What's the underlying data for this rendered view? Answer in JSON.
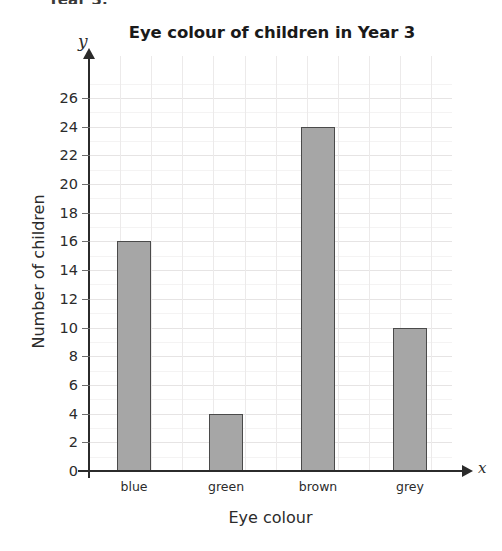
{
  "page": {
    "cropped_header_text": "Year 3."
  },
  "chart_data": {
    "type": "bar",
    "title": "Eye colour of children in Year 3",
    "categories": [
      "blue",
      "green",
      "brown",
      "grey"
    ],
    "values": [
      16,
      4,
      24,
      10
    ],
    "xlabel": "Eye colour",
    "ylabel": "Number of children",
    "ylim": [
      0,
      27
    ],
    "ytick_labels": [
      "0",
      "2",
      "4",
      "6",
      "8",
      "10",
      "12",
      "14",
      "16",
      "18",
      "20",
      "22",
      "24",
      "26"
    ],
    "ytick_values": [
      0,
      2,
      4,
      6,
      8,
      10,
      12,
      14,
      16,
      18,
      20,
      22,
      24,
      26
    ],
    "grid": true,
    "legend": "none",
    "x_axis_marker": "x",
    "y_axis_marker": "y",
    "bar_fill_color": "#a6a6a6",
    "bar_border_color": "#4a4a4a",
    "gridline_color": "#eceaea",
    "axis_color": "#2b2b2b"
  }
}
